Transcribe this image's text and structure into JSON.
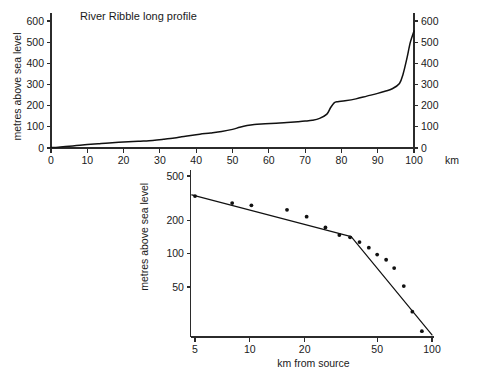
{
  "figure": {
    "background": "#ffffff",
    "ink_color": "#111111",
    "axis_color": "#2b2b2b"
  },
  "chart_data": [
    {
      "id": "long-profile",
      "type": "line",
      "title": "River Ribble long profile",
      "xlabel": "km",
      "ylabel": "metres above sea level",
      "xlim": [
        0,
        100
      ],
      "ylim": [
        0,
        650
      ],
      "grid": false,
      "legend": null,
      "x_ticks": [
        0,
        10,
        20,
        30,
        40,
        50,
        60,
        70,
        80,
        90,
        100
      ],
      "y_ticks": [
        0,
        100,
        200,
        300,
        400,
        500,
        600
      ],
      "y_ticks_right": [
        0,
        100,
        200,
        300,
        400,
        500,
        600
      ],
      "x_scale": "linear",
      "y_scale": "linear",
      "x": [
        0,
        2,
        4,
        6,
        8,
        10,
        13,
        16,
        20,
        24,
        28,
        31,
        34,
        36,
        38,
        41,
        44,
        47,
        50,
        52,
        54,
        56,
        59,
        62,
        65,
        68,
        70,
        72,
        74,
        76,
        77,
        78,
        79,
        81,
        84,
        87,
        90,
        92,
        94,
        96,
        97,
        98,
        99,
        100
      ],
      "y": [
        2,
        4,
        7,
        10,
        13,
        16,
        20,
        24,
        28,
        32,
        36,
        41,
        47,
        53,
        58,
        65,
        71,
        78,
        88,
        98,
        106,
        111,
        114,
        117,
        120,
        124,
        127,
        131,
        140,
        160,
        190,
        213,
        219,
        223,
        232,
        245,
        258,
        268,
        280,
        305,
        350,
        420,
        500,
        553
      ]
    },
    {
      "id": "log-log-gradient",
      "type": "scatter",
      "title": "",
      "xlabel": "km from source",
      "ylabel": "metres above sea level",
      "x_scale": "log",
      "y_scale": "log",
      "xlim": [
        4,
        105
      ],
      "ylim": [
        18,
        520
      ],
      "grid": false,
      "legend": null,
      "x_ticks": [
        5,
        10,
        20,
        50,
        100
      ],
      "y_ticks": [
        50,
        100,
        200,
        500
      ],
      "points": [
        {
          "x": 5.0,
          "y": 330
        },
        {
          "x": 8.0,
          "y": 285
        },
        {
          "x": 10.2,
          "y": 272
        },
        {
          "x": 16.0,
          "y": 248
        },
        {
          "x": 20.5,
          "y": 215
        },
        {
          "x": 26.0,
          "y": 172
        },
        {
          "x": 31.0,
          "y": 147
        },
        {
          "x": 35.5,
          "y": 140
        },
        {
          "x": 40.0,
          "y": 127
        },
        {
          "x": 45.0,
          "y": 113
        },
        {
          "x": 50.0,
          "y": 98
        },
        {
          "x": 56.0,
          "y": 88
        },
        {
          "x": 62.0,
          "y": 74
        },
        {
          "x": 70.0,
          "y": 51
        },
        {
          "x": 78.0,
          "y": 30
        },
        {
          "x": 88.0,
          "y": 20
        }
      ],
      "fit_segments": [
        {
          "name": "upper-reach",
          "from": {
            "x": 4.8,
            "y": 338
          },
          "to": {
            "x": 36.0,
            "y": 142
          }
        },
        {
          "name": "lower-reach",
          "from": {
            "x": 36.0,
            "y": 142
          },
          "to": {
            "x": 100.0,
            "y": 18.5
          }
        }
      ]
    }
  ]
}
